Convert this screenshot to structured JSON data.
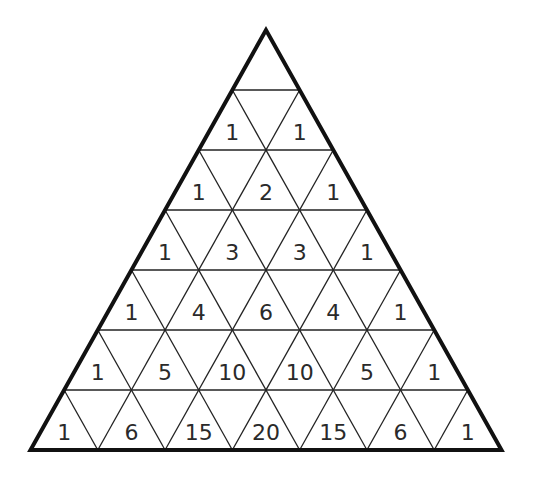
{
  "diagram": {
    "title": "",
    "type": "pascal-triangle-grid",
    "rows": 7,
    "apex_blank": true,
    "numbers": [
      [],
      [
        1,
        1
      ],
      [
        1,
        2,
        1
      ],
      [
        1,
        3,
        3,
        1
      ],
      [
        1,
        4,
        6,
        4,
        1
      ],
      [
        1,
        5,
        10,
        10,
        5,
        1
      ],
      [
        1,
        6,
        15,
        20,
        15,
        6,
        1
      ]
    ],
    "colors": {
      "background": "#ffffff",
      "line": "#222222",
      "text": "#2a2a2a"
    }
  }
}
